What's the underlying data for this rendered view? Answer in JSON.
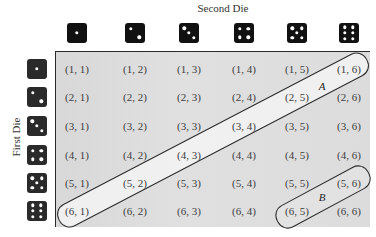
{
  "titles": {
    "second_die": "Second Die",
    "first_die": "First Die"
  },
  "colors": {
    "die_face": "#111111",
    "pip": "#ffffff",
    "panel_bg": "#dcdcdc",
    "band_fill": "#f2f2f2",
    "outline": "#2a2a2a"
  },
  "top_dice": [
    1,
    2,
    3,
    4,
    5,
    6
  ],
  "left_dice": [
    1,
    2,
    3,
    4,
    5,
    6
  ],
  "grid": {
    "rows": [
      [
        "(1, 1)",
        "(1, 2)",
        "(1, 3)",
        "(1, 4)",
        "(1, 5)",
        "(1, 6)"
      ],
      [
        "(2, 1)",
        "(2, 2)",
        "(2, 3)",
        "(2, 4)",
        "(2, 5)",
        "(2, 6)"
      ],
      [
        "(3, 1)",
        "(3, 2)",
        "(3, 3)",
        "(3, 4)",
        "(3, 5)",
        "(3, 6)"
      ],
      [
        "(4, 1)",
        "(4, 2)",
        "(4, 3)",
        "(4, 4)",
        "(4, 5)",
        "(4, 6)"
      ],
      [
        "(5, 1)",
        "(5, 2)",
        "(5, 3)",
        "(5, 4)",
        "(5, 5)",
        "(5, 6)"
      ],
      [
        "(6, 1)",
        "(6, 2)",
        "(6, 3)",
        "(6, 4)",
        "(6, 5)",
        "(6, 6)"
      ]
    ]
  },
  "events": {
    "A": {
      "label": "A",
      "outcomes": [
        "(1, 6)",
        "(2, 5)",
        "(3, 4)",
        "(4, 3)",
        "(5, 2)",
        "(6, 1)"
      ]
    },
    "B": {
      "label": "B",
      "outcomes": [
        "(5, 6)",
        "(6, 5)"
      ]
    }
  }
}
